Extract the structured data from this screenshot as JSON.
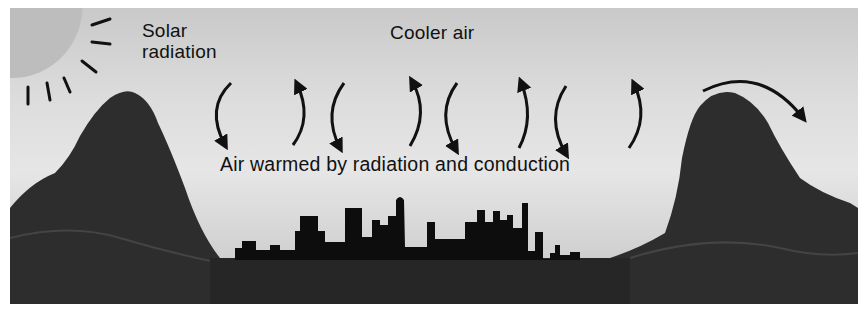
{
  "figure": {
    "labels": {
      "solar": [
        "Solar",
        "radiation"
      ],
      "cooler_air": "Cooler air",
      "warmed_air": "Air warmed by radiation and conduction"
    },
    "elements": {
      "sun": "sun-with-rays",
      "left_mountain": "mountain",
      "right_mountain": "mountain",
      "city": "city-skyline-silhouette",
      "convection_arrows": 12,
      "wind_over_mountain": "curved-arrow-right"
    },
    "colors": {
      "sky_top": "#c9c9c9",
      "sky_mid": "#e6e6e6",
      "sun": "#bdbdbd",
      "terrain": "#2a2a2a",
      "skyline": "#0d0d0d",
      "ink": "#111111"
    }
  }
}
